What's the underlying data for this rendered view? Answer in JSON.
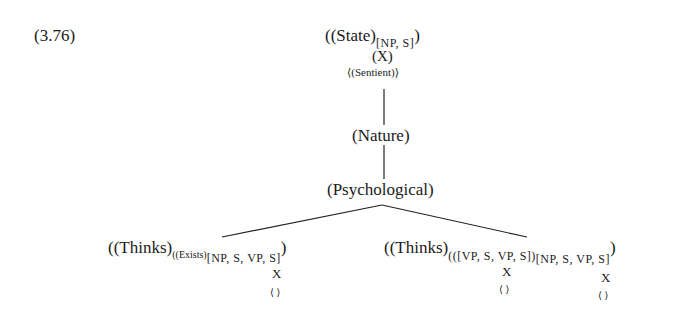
{
  "example_number": "(3.76)",
  "root": {
    "label": "((State)",
    "subscript": "[NP, S]",
    "close": ")",
    "marker": "(X)",
    "feature": "⟨(Sentient)⟩"
  },
  "level2": {
    "label": "(Nature)"
  },
  "level3": {
    "label": "(Psychological)"
  },
  "left_leaf": {
    "label": "((Thinks)",
    "subscript_small": "((Exists)",
    "subscript": "[NP, S, VP, S]",
    "close": ")",
    "close_outer": ")",
    "marker": "X",
    "feature": "⟨ ⟩"
  },
  "right_leaf": {
    "label": "((Thinks)",
    "subscript1": "(([VP, S, VP, S])",
    "subscript2": "[NP, S, VP, S]",
    "close": ")",
    "close_outer": ")",
    "marker1": "X",
    "feature1": "⟨ ⟩",
    "marker2": "X",
    "feature2": "⟨ ⟩"
  }
}
